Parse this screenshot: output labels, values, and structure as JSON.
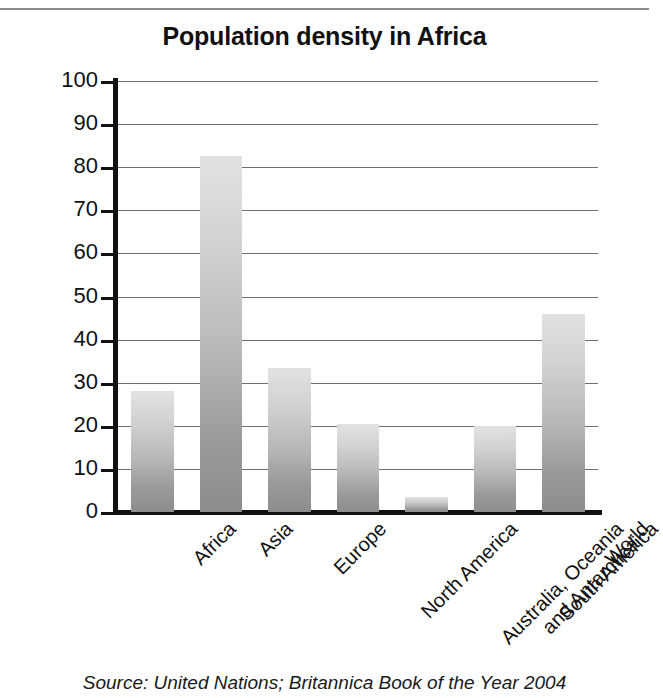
{
  "figure": {
    "source_note": "Source: United Nations; Britannica Book of the Year 2004"
  },
  "chart_data": {
    "type": "bar",
    "title": "Population density in Africa",
    "xlabel": "",
    "ylabel": "people per sq km",
    "ylim": [
      0,
      100
    ],
    "ytick_step": 10,
    "yticks": [
      0,
      10,
      20,
      30,
      40,
      50,
      60,
      70,
      80,
      90,
      100
    ],
    "grid": true,
    "legend": "none",
    "bar_color_top": "#e2e2e2",
    "bar_color_bottom": "#8d8d8d",
    "categories": [
      "Africa",
      "Asia",
      "Europe",
      "North America",
      "Australia, Oceania\nand Antarctica",
      "South America",
      "World"
    ],
    "category_labels": [
      {
        "line1": "Africa",
        "line2": ""
      },
      {
        "line1": "Asia",
        "line2": ""
      },
      {
        "line1": "Europe",
        "line2": ""
      },
      {
        "line1": "North America",
        "line2": ""
      },
      {
        "line1": "Australia, Oceania",
        "line2": "and Antarctica"
      },
      {
        "line1": "South America",
        "line2": ""
      },
      {
        "line1": "World",
        "line2": ""
      }
    ],
    "values": [
      28,
      82.5,
      33.5,
      20.5,
      3.5,
      20,
      46
    ]
  }
}
